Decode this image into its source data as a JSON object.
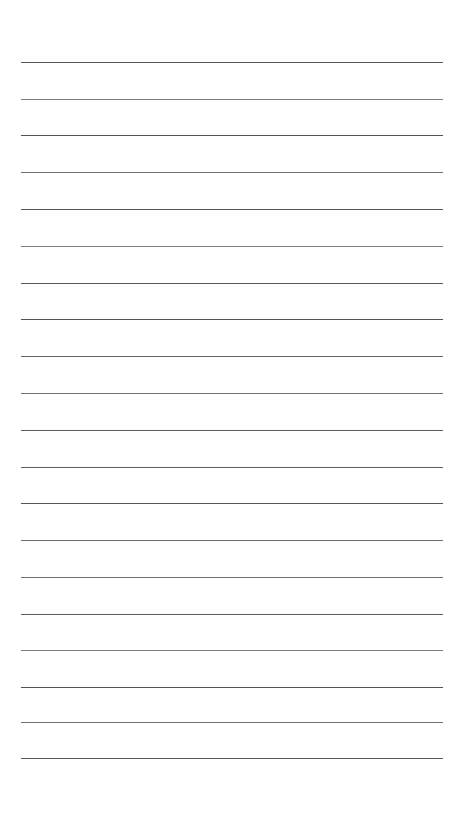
{
  "page": {
    "type": "ruled-paper",
    "width": 459,
    "height": 817,
    "background_color": "#ffffff"
  },
  "rules": {
    "count": 20,
    "color": "#4a4a4a",
    "thickness_px": 1,
    "left_x": 21,
    "right_x": 443,
    "length_px": 422,
    "first_y": 62,
    "spacing_px": 36.6,
    "lines": [
      {
        "index": 1,
        "y": 62,
        "opacity": 0.95
      },
      {
        "index": 2,
        "y": 99,
        "opacity": 0.72
      },
      {
        "index": 3,
        "y": 135,
        "opacity": 0.95
      },
      {
        "index": 4,
        "y": 172,
        "opacity": 0.8
      },
      {
        "index": 5,
        "y": 209,
        "opacity": 0.95
      },
      {
        "index": 6,
        "y": 246,
        "opacity": 0.7
      },
      {
        "index": 7,
        "y": 283,
        "opacity": 0.92
      },
      {
        "index": 8,
        "y": 319,
        "opacity": 0.95
      },
      {
        "index": 9,
        "y": 356,
        "opacity": 0.85
      },
      {
        "index": 10,
        "y": 393,
        "opacity": 0.78
      },
      {
        "index": 11,
        "y": 430,
        "opacity": 0.9
      },
      {
        "index": 12,
        "y": 467,
        "opacity": 0.88
      },
      {
        "index": 13,
        "y": 503,
        "opacity": 0.92
      },
      {
        "index": 14,
        "y": 540,
        "opacity": 0.82
      },
      {
        "index": 15,
        "y": 577,
        "opacity": 0.8
      },
      {
        "index": 16,
        "y": 614,
        "opacity": 0.9
      },
      {
        "index": 17,
        "y": 650,
        "opacity": 0.7
      },
      {
        "index": 18,
        "y": 687,
        "opacity": 0.95
      },
      {
        "index": 19,
        "y": 722,
        "opacity": 0.78
      },
      {
        "index": 20,
        "y": 758,
        "opacity": 0.92
      }
    ]
  }
}
